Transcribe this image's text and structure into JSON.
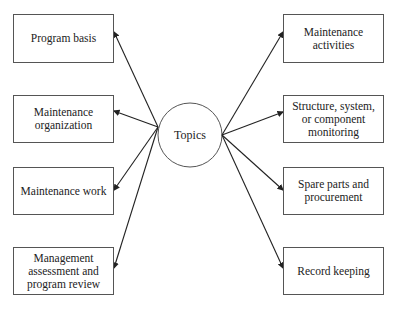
{
  "center": {
    "label": "Topics"
  },
  "left_topics": [
    {
      "label": "Program basis"
    },
    {
      "label": "Maintenance organization"
    },
    {
      "label": "Maintenance work"
    },
    {
      "label": "Management assessment and program review"
    }
  ],
  "right_topics": [
    {
      "label": "Maintenance activities"
    },
    {
      "label": "Structure, system, or component monitoring"
    },
    {
      "label": "Spare parts and procurement"
    },
    {
      "label": "Record keeping"
    }
  ]
}
